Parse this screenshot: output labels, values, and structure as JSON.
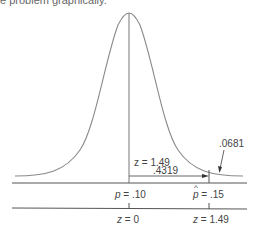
{
  "caption_fragment": "e problem graphically.",
  "diagram": {
    "curve": {
      "type": "normal",
      "stroke": "#8a8a8a",
      "mean_x": 129,
      "peak_y": 13,
      "baseline_y": 176
    },
    "annotations": {
      "z_label": "z = 1.49",
      "area_between": ".4319",
      "tail_area": ".0681"
    },
    "axis_top": {
      "ticks": [
        {
          "var": "p",
          "hat": false,
          "value": "= .10"
        },
        {
          "var": "p",
          "hat": true,
          "value": "= .15"
        }
      ]
    },
    "axis_bottom": {
      "ticks": [
        {
          "var": "z",
          "value": "= 0"
        },
        {
          "var": "z",
          "value": "= 1.49"
        }
      ]
    },
    "colors": {
      "line": "#8a8a8a",
      "axis": "#555555",
      "text": "#444444"
    }
  }
}
